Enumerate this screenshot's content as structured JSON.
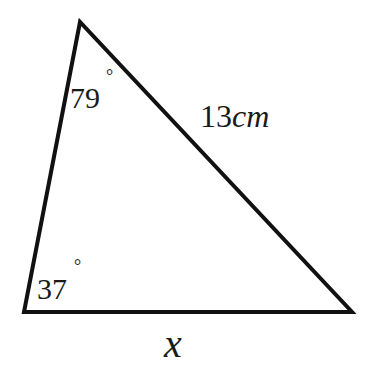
{
  "diagram": {
    "type": "triangle",
    "vertices": {
      "top": [
        80,
        22
      ],
      "bottom_left": [
        24,
        312
      ],
      "bottom_right": [
        352,
        312
      ]
    },
    "stroke_color": "#111111",
    "labels": {
      "top_angle": "79",
      "bottom_left_angle": "37",
      "degree_symbol": "°",
      "right_side_length_number": "13",
      "right_side_length_unit": "cm",
      "bottom_side": "x"
    }
  }
}
